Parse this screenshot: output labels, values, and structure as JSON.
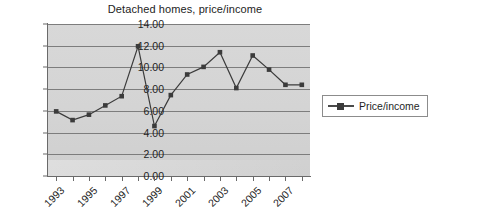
{
  "chart_data": {
    "type": "line",
    "title": "Detached homes, price/income",
    "xlabel": "",
    "ylabel": "",
    "ylim": [
      0,
      14
    ],
    "ytick_step": 2,
    "grid": true,
    "legend_position": "right",
    "series": [
      {
        "name": "Price/income",
        "marker": "square",
        "color": "#3b3b3b",
        "x": [
          1993,
          1994,
          1995,
          1996,
          1997,
          1998,
          1999,
          2000,
          2001,
          2002,
          2003,
          2004,
          2005,
          2006,
          2007,
          2008
        ],
        "values": [
          5.95,
          5.15,
          5.65,
          6.5,
          7.35,
          11.95,
          4.6,
          7.45,
          9.35,
          10.05,
          11.4,
          8.1,
          11.1,
          9.8,
          8.4,
          8.4
        ]
      }
    ],
    "y_ticks": [
      "0.00",
      "2.00",
      "4.00",
      "6.00",
      "8.00",
      "10.00",
      "12.00",
      "14.00"
    ],
    "y_tick_values": [
      0,
      2,
      4,
      6,
      8,
      10,
      12,
      14
    ],
    "x_tick_values": [
      1993,
      1994,
      1995,
      1996,
      1997,
      1998,
      1999,
      2000,
      2001,
      2002,
      2003,
      2004,
      2005,
      2006,
      2007,
      2008
    ],
    "x_tick_labels": [
      "1993",
      "",
      "1995",
      "",
      "1997",
      "",
      "1999",
      "",
      "2001",
      "",
      "2003",
      "",
      "2005",
      "",
      "2007",
      ""
    ],
    "x_labels_shown": [
      "1993",
      "1995",
      "1997",
      "1999",
      "2001",
      "2003",
      "2005",
      "2007"
    ],
    "colors": {
      "plot_background": "#d6d6d6",
      "gridline": "#7d7d7d",
      "axis": "#6a6a6a",
      "series": "#3b3b3b",
      "text": "#1f1f1f",
      "page_background": "#ffffff"
    }
  },
  "legend": {
    "entries": [
      {
        "label": "Price/income",
        "marker": "square-marker-icon"
      }
    ]
  }
}
